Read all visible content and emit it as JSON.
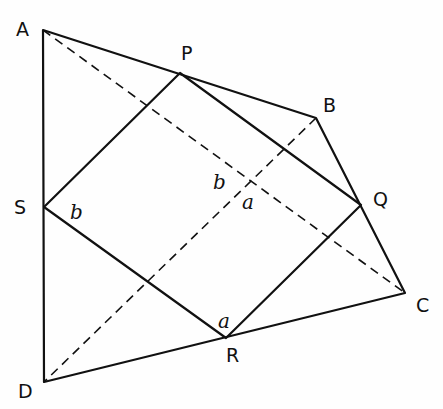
{
  "diagram": {
    "type": "geometry",
    "vertices": {
      "A": {
        "label": "A",
        "x": 43,
        "y": 30
      },
      "B": {
        "label": "B",
        "x": 316,
        "y": 118
      },
      "C": {
        "label": "C",
        "x": 405,
        "y": 293
      },
      "D": {
        "label": "D",
        "x": 44,
        "y": 382
      },
      "P": {
        "label": "P",
        "x": 180,
        "y": 73
      },
      "Q": {
        "label": "Q",
        "x": 361,
        "y": 205
      },
      "R": {
        "label": "R",
        "x": 226,
        "y": 338
      },
      "S": {
        "label": "S",
        "x": 44,
        "y": 207
      }
    },
    "angle_labels": [
      {
        "text": "b",
        "x": 72,
        "y": 217,
        "note": "angle at S"
      },
      {
        "text": "b",
        "x": 214,
        "y": 190,
        "note": "angle at diagonal intersection"
      },
      {
        "text": "a",
        "x": 243,
        "y": 208,
        "note": "angle at diagonal intersection"
      },
      {
        "text": "a",
        "x": 219,
        "y": 327,
        "note": "angle at R"
      }
    ],
    "solid_segments": [
      "AB",
      "BC",
      "CD",
      "DA",
      "PQ",
      "QR",
      "RS",
      "SP"
    ],
    "dashed_segments": [
      "AC",
      "BD"
    ],
    "colors": {
      "ink": "#111111",
      "background": "#fefefe"
    }
  }
}
